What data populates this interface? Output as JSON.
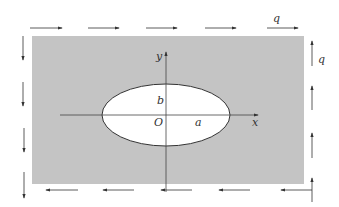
{
  "diagram": {
    "colors": {
      "plate": "#c4c4c4",
      "hole": "#ffffff",
      "line": "#333333"
    },
    "labels": {
      "y_axis": "y",
      "x_axis": "x",
      "origin": "O",
      "semi_major": "a",
      "semi_minor": "b",
      "shear_top": "q",
      "shear_right": "q"
    },
    "loads": {
      "top": {
        "direction": "right",
        "count": 5
      },
      "bottom": {
        "direction": "left",
        "count": 5
      },
      "left": {
        "direction": "down",
        "count": 4
      },
      "right": {
        "direction": "up",
        "count": 4
      }
    }
  }
}
